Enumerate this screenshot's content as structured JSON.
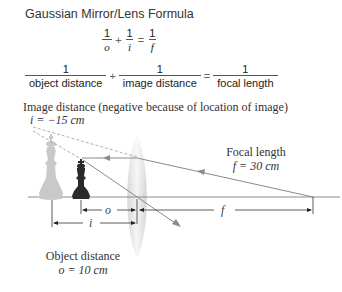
{
  "title": "Gaussian Mirror/Lens Formula",
  "formula_symbolic": {
    "terms": [
      {
        "numerator": "1",
        "denominator": "o"
      },
      {
        "numerator": "1",
        "denominator": "i"
      },
      {
        "numerator": "1",
        "denominator": "f"
      }
    ],
    "operators": [
      "+",
      "="
    ]
  },
  "formula_words": {
    "terms": [
      {
        "numerator": "1",
        "denominator": "object distance"
      },
      {
        "numerator": "1",
        "denominator": "image distance"
      },
      {
        "numerator": "1",
        "denominator": "focal length"
      }
    ],
    "operators": [
      "+",
      "="
    ]
  },
  "diagram": {
    "image_label": "Image distance (negative because of location of image)",
    "image_value": "i = −15 cm",
    "focal_label": "Focal length",
    "focal_value": "f = 30 cm",
    "object_label": "Object distance",
    "object_value": "o = 10 cm",
    "dim_o": "o",
    "dim_i": "i",
    "dim_f": "f",
    "colors": {
      "ray": "#8a8a8a",
      "dashed_ray": "#b0b0b0",
      "axis": "#8a8a8a",
      "lens": "#dcdcdc",
      "object_piece": "#2a2a2a",
      "image_piece": "#c9c9c9",
      "dimension_line": "#333333"
    }
  }
}
